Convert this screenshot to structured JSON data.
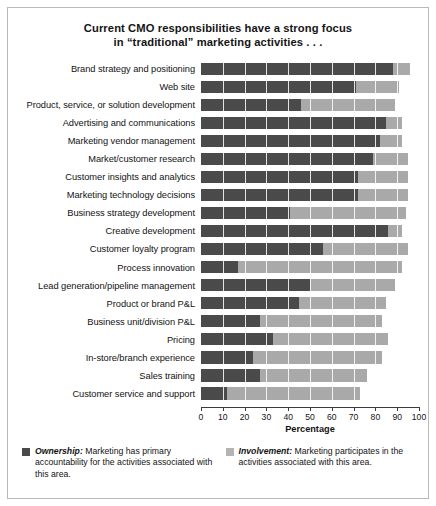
{
  "title": {
    "line1": "Current CMO responsibilities have a strong focus",
    "line2": "in “traditional” marketing activities . . ."
  },
  "legend": {
    "ownership": {
      "swatch_color": "#4a4a4a",
      "lead": "Ownership:",
      "body": " Marketing has primary accountability for the activities associated with this area."
    },
    "involvement": {
      "swatch_color": "#b4b4b4",
      "lead": "Involvement:",
      "body": " Marketing participates in the activities associated with this area."
    }
  },
  "chart_data": {
    "type": "bar",
    "orientation": "horizontal",
    "stacked": true,
    "title": "Current CMO responsibilities have a strong focus in “traditional” marketing activities . . .",
    "xlabel": "Percentage",
    "ylabel": "",
    "xlim": [
      0,
      100
    ],
    "xticks": [
      0,
      10,
      20,
      30,
      40,
      50,
      60,
      70,
      80,
      90,
      100
    ],
    "grid": false,
    "legend_position": "bottom",
    "categories": [
      "Brand strategy and positioning",
      "Web site",
      "Product, service, or solution development",
      "Advertising and communications",
      "Marketing vendor management",
      "Market/customer research",
      "Customer insights and analytics",
      "Marketing technology decisions",
      "Business strategy development",
      "Creative development",
      "Customer loyalty program",
      "Process innovation",
      "Lead generation/pipeline management",
      "Product or brand P&L",
      "Business unit/division P&L",
      "Pricing",
      "In-store/branch experience",
      "Sales training",
      "Customer service and support"
    ],
    "series": [
      {
        "name": "Ownership",
        "color": "#4a4a4a",
        "values": [
          88,
          71,
          46,
          85,
          82,
          79,
          72,
          72,
          41,
          86,
          56,
          17,
          50,
          45,
          27,
          33,
          24,
          27,
          12
        ]
      },
      {
        "name": "Involvement",
        "color": "#a9a9a9",
        "values": [
          8,
          20,
          43,
          7,
          10,
          16,
          23,
          23,
          53,
          6,
          39,
          75,
          39,
          40,
          56,
          53,
          59,
          49,
          61
        ]
      }
    ],
    "totals": [
      96,
      91,
      89,
      92,
      92,
      95,
      95,
      95,
      94,
      92,
      95,
      92,
      89,
      85,
      83,
      86,
      83,
      76,
      73
    ]
  }
}
